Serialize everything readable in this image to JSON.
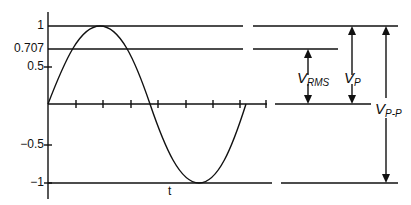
{
  "diagram": {
    "y_axis": {
      "ticks": [
        {
          "value": "1",
          "y": 26
        },
        {
          "value": "0.707",
          "y": 49
        },
        {
          "value": "0.5",
          "y": 67
        },
        {
          "value": "−0.5",
          "y": 145
        },
        {
          "value": "−1",
          "y": 183
        }
      ]
    },
    "x_axis": {
      "label": "t"
    },
    "measurements": {
      "rms": {
        "main": "V",
        "sub": "RMS"
      },
      "peak": {
        "main": "V",
        "sub": "P"
      },
      "peak_to_peak": {
        "main": "V",
        "sub": "P-P"
      }
    },
    "colors": {
      "line": "#111111",
      "background": "#ffffff"
    }
  }
}
